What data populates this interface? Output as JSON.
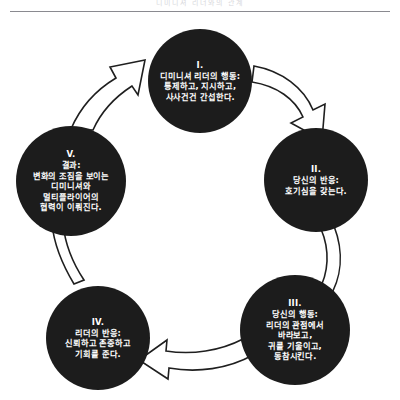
{
  "header": {
    "running_head": "디미니셔 리더와의 관계"
  },
  "diagram": {
    "type": "cycle",
    "node_fill_color": "#1c1c1c",
    "node_text_color": "#ffffff",
    "arrow_fill_color": "#ffffff",
    "arrow_stroke_color": "#1f1f1f",
    "background_color": "#ffffff",
    "nodes": [
      {
        "id": "node-1",
        "roman": "I.",
        "lines": [
          "디미니셔 리더의 행동:",
          "통제하고, 지시하고,",
          "사사건건 간섭한다."
        ]
      },
      {
        "id": "node-2",
        "roman": "II.",
        "lines": [
          "당신의 반응:",
          "호기심을 갖는다."
        ]
      },
      {
        "id": "node-3",
        "roman": "III.",
        "lines": [
          "당신의 행동:",
          "리더의 관점에서",
          "바라보고,",
          "귀를 기울이고,",
          "동참시킨다."
        ]
      },
      {
        "id": "node-4",
        "roman": "IV.",
        "lines": [
          "리더의 반응:",
          "신뢰하고 존중하고",
          "기회를 준다."
        ]
      },
      {
        "id": "node-5",
        "roman": "V.",
        "lines": [
          "결과:",
          "변화의 조짐을 보이는",
          "디미니셔와",
          "멀티플라이어의",
          "협력이 이뤄진다."
        ]
      }
    ],
    "arrows": [
      {
        "id": "arrow-1-to-2",
        "from": "I.",
        "to": "II.",
        "direction": "curved-down-right"
      },
      {
        "id": "arrow-2-to-3",
        "from": "II.",
        "to": "III.",
        "direction": "curved-down-left"
      },
      {
        "id": "arrow-3-to-4",
        "from": "III.",
        "to": "IV.",
        "direction": "curved-left"
      },
      {
        "id": "arrow-4-to-5",
        "from": "IV.",
        "to": "V.",
        "direction": "curved-up"
      },
      {
        "id": "arrow-5-to-1",
        "from": "V.",
        "to": "I.",
        "direction": "curved-up-right"
      }
    ]
  }
}
